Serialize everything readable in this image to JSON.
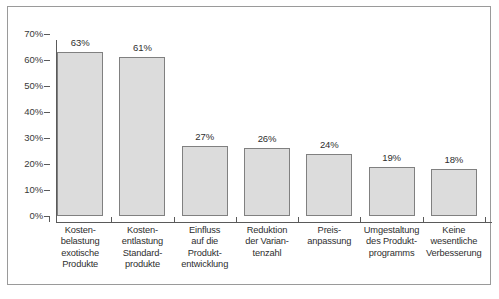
{
  "chart_data": {
    "type": "bar",
    "title": "",
    "subtitle": "",
    "xlabel": "",
    "ylabel": "",
    "categories": [
      "Kosten-\nbelastung\nexotische\nProdukte",
      "Kosten-\nentlastung\nStandard-\nprodukte",
      "Einfluss\nauf die\nProdukt-\nentwicklung",
      "Reduktion\nder Varian-\ntenzahl",
      "Preis-\nanpassung",
      "Umgestaltung\ndes Produkt-\nprogramms",
      "Keine\nwesentliche\nVerbesserung"
    ],
    "values": [
      63,
      61,
      27,
      26,
      24,
      19,
      18
    ],
    "value_labels": [
      "63%",
      "61%",
      "27%",
      "26%",
      "24%",
      "19%",
      "18%"
    ],
    "ylim": [
      0,
      70
    ],
    "ytick_values": [
      0,
      10,
      20,
      30,
      40,
      50,
      60,
      70
    ],
    "ytick_labels": [
      "0%",
      "10%",
      "20%",
      "30%",
      "40%",
      "50%",
      "60%",
      "70%"
    ],
    "grid": false,
    "legend": null,
    "legend_position": "none",
    "bar_fill_color": "#dcdcdc",
    "bar_border_color": "#808080",
    "axis_color": "#5a5a5a",
    "text_color": "#2e2e2e",
    "frame_color": "#9a9a9a",
    "background_color": "#ffffff"
  }
}
